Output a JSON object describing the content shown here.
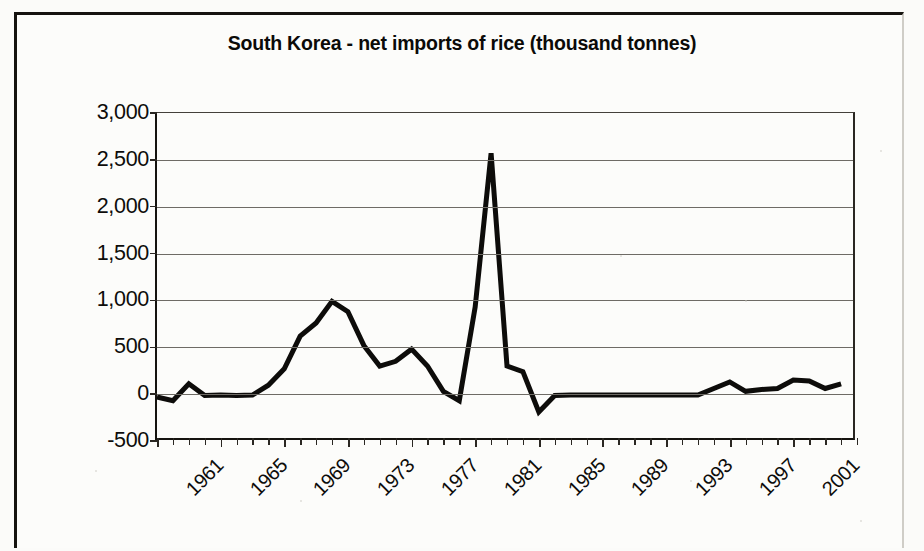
{
  "chart_data": {
    "type": "line",
    "title": "South Korea - net imports of rice (thousand tonnes)",
    "xlabel": "",
    "ylabel": "",
    "ylim": [
      -500,
      3000
    ],
    "xlim": [
      1961,
      2005
    ],
    "y_ticks": [
      3000,
      2500,
      2000,
      1500,
      1000,
      500,
      0,
      -500
    ],
    "y_tick_labels": [
      "3,000",
      "2,500",
      "2,000",
      "1,500",
      "1,000",
      "500",
      "0",
      "-500"
    ],
    "x_tick_labels": [
      "1961",
      "1965",
      "1969",
      "1973",
      "1977",
      "1981",
      "1985",
      "1989",
      "1993",
      "1997",
      "2001"
    ],
    "x_tick_years": [
      1961,
      1965,
      1969,
      1973,
      1977,
      1981,
      1985,
      1989,
      1993,
      1997,
      2001
    ],
    "grid": "horizontal",
    "legend": "none",
    "line_color": "#0d0c0a",
    "line_width": 5,
    "x": [
      1961,
      1962,
      1963,
      1964,
      1965,
      1966,
      1967,
      1968,
      1969,
      1970,
      1971,
      1972,
      1973,
      1974,
      1975,
      1976,
      1977,
      1978,
      1979,
      1980,
      1981,
      1982,
      1983,
      1984,
      1985,
      1986,
      1987,
      1988,
      1989,
      1990,
      1991,
      1992,
      1993,
      1994,
      1995,
      1996,
      1997,
      1998,
      1999,
      2000,
      2001,
      2002,
      2003,
      2004
    ],
    "values": [
      -30,
      -70,
      110,
      -15,
      -10,
      -15,
      -10,
      95,
      270,
      620,
      760,
      990,
      880,
      520,
      300,
      350,
      480,
      300,
      30,
      -70,
      930,
      2570,
      300,
      240,
      -190,
      -15,
      -10,
      -10,
      -10,
      -10,
      -10,
      -10,
      -10,
      -10,
      -10,
      60,
      130,
      30,
      50,
      60,
      150,
      140,
      60,
      110
    ],
    "series": [
      {
        "name": "net imports of rice",
        "values": [
          -30,
          -70,
          110,
          -15,
          -10,
          -15,
          -10,
          95,
          270,
          620,
          760,
          990,
          880,
          520,
          300,
          350,
          480,
          300,
          30,
          -70,
          930,
          2570,
          300,
          240,
          -190,
          -15,
          -10,
          -10,
          -10,
          -10,
          -10,
          -10,
          -10,
          -10,
          -10,
          60,
          130,
          30,
          50,
          60,
          150,
          140,
          60,
          110
        ]
      }
    ],
    "annotations": [],
    "units": "thousand tonnes",
    "country": "South Korea"
  }
}
